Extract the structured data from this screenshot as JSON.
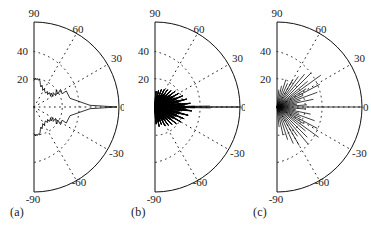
{
  "figure": {
    "panels": [
      {
        "id": "a",
        "caption": "(a)"
      },
      {
        "id": "b",
        "caption": "(b)"
      },
      {
        "id": "c",
        "caption": "(c)"
      }
    ]
  },
  "chart_data": [
    {
      "type": "line",
      "subtype": "polar-half-plane",
      "panel": "a",
      "title": "",
      "xlabel": "",
      "ylabel": "",
      "angle_unit": "degrees",
      "angle_ticks": [
        90,
        60,
        30,
        0,
        -30,
        -60,
        -90
      ],
      "angle_tick_labels": [
        "90",
        "60",
        "30",
        "0",
        "-30",
        "-60",
        "-90"
      ],
      "angle_range": [
        -90,
        90
      ],
      "radial_ticks": [
        20,
        40,
        60
      ],
      "radial_tick_labels": [
        "20",
        "40",
        ""
      ],
      "radial_labels_shown": [
        "40",
        "20"
      ],
      "rlim": [
        0,
        60
      ],
      "grid": "dotted arcs at r=20 and r=40, dotted radial rays every 30 deg",
      "legend": "none",
      "trace_style": "continuous noisy spectrum",
      "main_lobe_angle": 0,
      "main_lobe_peak": 60,
      "series": [
        {
          "name": "spatial spectrum (a)",
          "angles": [
            -90,
            -87,
            -84,
            -81,
            -78,
            -75,
            -72,
            -69,
            -66,
            -63,
            -60,
            -57,
            -54,
            -51,
            -48,
            -45,
            -42,
            -39,
            -36,
            -33,
            -30,
            -27,
            -24,
            -21,
            -18,
            -15,
            -12,
            -9,
            -6,
            -3,
            0,
            3,
            6,
            9,
            12,
            15,
            18,
            21,
            24,
            27,
            30,
            33,
            36,
            39,
            42,
            45,
            48,
            51,
            54,
            57,
            60,
            63,
            66,
            69,
            72,
            75,
            78,
            81,
            84,
            87,
            90
          ],
          "values": [
            19,
            20.5,
            19.2,
            21,
            19.6,
            20.2,
            18.8,
            16,
            13.5,
            15.5,
            13,
            11,
            13.8,
            10.5,
            12.5,
            9.5,
            11.5,
            8,
            10.5,
            13.5,
            9,
            12,
            7.5,
            10.5,
            15,
            11,
            17,
            13,
            20,
            26,
            60,
            27,
            21,
            14,
            18,
            11,
            16,
            12,
            20,
            14,
            9.5,
            12.5,
            8.5,
            11,
            9,
            12,
            10.5,
            13,
            11,
            14.5,
            13.5,
            19.5,
            17,
            20.5,
            19,
            21,
            19.5,
            20.8,
            19.2,
            20.5,
            19
          ]
        }
      ]
    },
    {
      "type": "line",
      "subtype": "polar-half-plane",
      "panel": "b",
      "title": "",
      "xlabel": "",
      "ylabel": "",
      "angle_unit": "degrees",
      "angle_ticks": [
        90,
        60,
        30,
        0,
        -30,
        -60,
        -90
      ],
      "angle_tick_labels": [
        "90",
        "60",
        "30",
        "0",
        "-30",
        "-60",
        "-90"
      ],
      "angle_range": [
        -90,
        90
      ],
      "radial_ticks": [
        20,
        40,
        60
      ],
      "radial_tick_labels": [
        "20",
        "40",
        ""
      ],
      "radial_labels_shown": [
        "40",
        "20"
      ],
      "rlim": [
        0,
        60
      ],
      "grid": "dotted arcs at r=20 and r=40, dotted radial rays every 30 deg",
      "legend": "none",
      "trace_style": "dense narrow spikes concentrated near 0 deg, tapering toward +/-90",
      "main_lobe_angle": 0,
      "main_lobe_peak": 60,
      "series": [
        {
          "name": "spatial spectrum (b)",
          "angles": [
            -90,
            -86,
            -82,
            -78,
            -74,
            -70,
            -66,
            -62,
            -58,
            -54,
            -50,
            -46,
            -42,
            -38,
            -34,
            -30,
            -26,
            -22,
            -18,
            -14,
            -10,
            -6,
            -2,
            0,
            2,
            6,
            10,
            14,
            18,
            22,
            26,
            30,
            34,
            38,
            42,
            46,
            50,
            54,
            58,
            62,
            66,
            70,
            74,
            78,
            82,
            86,
            90
          ],
          "values": [
            4,
            12,
            5,
            14,
            6,
            13,
            5,
            15,
            6,
            16,
            7,
            17,
            8,
            19,
            9,
            21,
            10,
            22,
            11,
            24,
            12,
            26,
            18,
            60,
            17,
            25,
            12,
            23,
            11,
            21,
            10,
            19,
            9,
            18,
            8,
            16,
            7,
            15,
            6,
            14,
            5,
            13,
            4,
            12,
            4,
            11,
            3
          ]
        }
      ]
    },
    {
      "type": "line",
      "subtype": "polar-half-plane",
      "panel": "c",
      "title": "",
      "xlabel": "",
      "ylabel": "",
      "angle_unit": "degrees",
      "angle_ticks": [
        90,
        60,
        30,
        0,
        -30,
        -60,
        -90
      ],
      "angle_tick_labels": [
        "90",
        "60",
        "30",
        "0",
        "-30",
        "-60",
        "-90"
      ],
      "angle_range": [
        -90,
        90
      ],
      "radial_ticks": [
        20,
        40,
        60
      ],
      "radial_tick_labels": [
        "20",
        "40",
        ""
      ],
      "radial_labels_shown": [
        "40",
        "20"
      ],
      "rlim": [
        0,
        60
      ],
      "grid": "dotted arcs at r=20 and r=40, dotted radial rays every 30 deg",
      "legend": "none",
      "trace_style": "sparse long sharp spikes over wide angular spread",
      "main_lobe_angle": 0,
      "main_lobe_peak": 60,
      "series": [
        {
          "name": "spatial spectrum (c)",
          "angles": [
            -84,
            -78,
            -72,
            -66,
            -60,
            -55,
            -50,
            -45,
            -40,
            -36,
            -32,
            -28,
            -24,
            -20,
            -16,
            -12,
            -8,
            -4,
            0,
            4,
            8,
            12,
            16,
            20,
            24,
            28,
            32,
            36,
            40,
            45,
            50,
            55,
            60,
            66,
            72,
            78,
            84
          ],
          "values": [
            14,
            20,
            24,
            28,
            31,
            25,
            34,
            30,
            26,
            36,
            22,
            32,
            18,
            28,
            16,
            24,
            13,
            20,
            60,
            21,
            14,
            26,
            17,
            30,
            20,
            34,
            24,
            38,
            28,
            34,
            30,
            26,
            22,
            18,
            20,
            15,
            12
          ]
        }
      ]
    }
  ]
}
